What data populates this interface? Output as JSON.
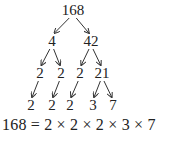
{
  "diagram": {
    "type": "factor-tree",
    "nodes": [
      {
        "id": "n168",
        "label": "168",
        "x": 73,
        "y": 3
      },
      {
        "id": "n4",
        "label": "4",
        "x": 52,
        "y": 34
      },
      {
        "id": "n42",
        "label": "42",
        "x": 91,
        "y": 34
      },
      {
        "id": "n2a",
        "label": "2",
        "x": 40,
        "y": 66
      },
      {
        "id": "n2b",
        "label": "2",
        "x": 61,
        "y": 66
      },
      {
        "id": "n2c",
        "label": "2",
        "x": 80,
        "y": 66
      },
      {
        "id": "n21",
        "label": "21",
        "x": 102,
        "y": 66
      },
      {
        "id": "l2a",
        "label": "2",
        "x": 31,
        "y": 98
      },
      {
        "id": "l2b",
        "label": "2",
        "x": 52,
        "y": 98
      },
      {
        "id": "l2c",
        "label": "2",
        "x": 70,
        "y": 98
      },
      {
        "id": "l3",
        "label": "3",
        "x": 93,
        "y": 98
      },
      {
        "id": "l7",
        "label": "7",
        "x": 113,
        "y": 98
      }
    ],
    "edges": [
      [
        "n168",
        "n4"
      ],
      [
        "n168",
        "n42"
      ],
      [
        "n4",
        "n2a"
      ],
      [
        "n4",
        "n2b"
      ],
      [
        "n42",
        "n2c"
      ],
      [
        "n42",
        "n21"
      ],
      [
        "n2a",
        "l2a"
      ],
      [
        "n2b",
        "l2b"
      ],
      [
        "n2c",
        "l2c"
      ],
      [
        "n21",
        "l3"
      ],
      [
        "n21",
        "l7"
      ]
    ],
    "equation": "168 = 2 × 2 × 2 × 3 × 7"
  }
}
